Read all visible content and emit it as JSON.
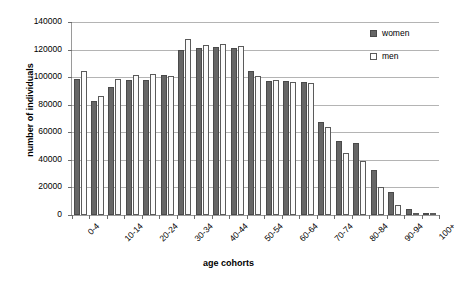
{
  "chart_data": {
    "type": "bar",
    "title": "",
    "xlabel": "age cohorts",
    "ylabel": "number of individuals",
    "ylim": [
      0,
      140000
    ],
    "ytick_values": [
      0,
      20000,
      40000,
      60000,
      80000,
      100000,
      120000,
      140000
    ],
    "ytick_labels": [
      "0",
      "20000",
      "40000",
      "60000",
      "80000",
      "100000",
      "120000",
      "140000"
    ],
    "grid": true,
    "legend_position": "top-right",
    "categories": [
      "0-4",
      "5-9",
      "10-14",
      "15-19",
      "20-24",
      "25-29",
      "30-34",
      "35-39",
      "40-44",
      "45-49",
      "50-54",
      "55-59",
      "60-64",
      "65-69",
      "70-74",
      "75-79",
      "80-84",
      "85-89",
      "90-94",
      "95-99",
      "100+"
    ],
    "visible_tick_labels": [
      "0-4",
      "10-14",
      "20-24",
      "30-34",
      "40-44",
      "50-54",
      "60-64",
      "70-74",
      "80-84",
      "90-94",
      "100+"
    ],
    "series": [
      {
        "name": "women",
        "color": "#666666",
        "values": [
          99000,
          82500,
          93000,
          98000,
          98000,
          101500,
          119500,
          121000,
          122000,
          121500,
          104500,
          97000,
          97000,
          96500,
          67500,
          53500,
          52000,
          32500,
          16500,
          4500,
          800
        ]
      },
      {
        "name": "men",
        "color": "#ffffff",
        "values": [
          104500,
          86500,
          98500,
          101500,
          102000,
          101000,
          127500,
          123000,
          124000,
          122500,
          101000,
          98000,
          96500,
          96000,
          64000,
          45000,
          39500,
          20500,
          7500,
          1500,
          300
        ]
      }
    ]
  },
  "legend": {
    "items": [
      {
        "label": "women"
      },
      {
        "label": "men"
      }
    ]
  }
}
